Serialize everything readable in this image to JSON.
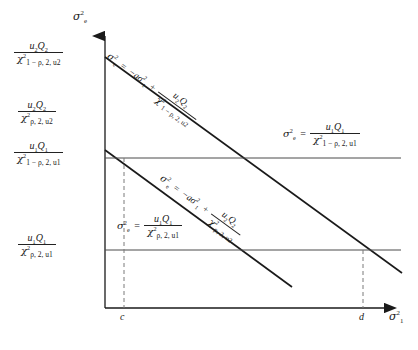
{
  "figure": {
    "type": "diagram",
    "title": "",
    "colors": {
      "line": "#1a1a1a",
      "thin_line": "#555555",
      "dashed": "#777777",
      "background": "#ffffff"
    }
  },
  "axes": {
    "y_label": {
      "base": "σ",
      "sup": "2",
      "sub": "e"
    },
    "x_label": {
      "base": "σ",
      "sup": "2",
      "sub": "1"
    },
    "x_ticks": [
      {
        "label": "c",
        "x": 124
      },
      {
        "label": "d",
        "x": 363
      }
    ]
  },
  "y_axis_labels": [
    {
      "id": "upper-diagonal-intercept",
      "num": {
        "u": "u",
        "u_sub": "2",
        "q": "Q",
        "q_sub": "2"
      },
      "den": {
        "chi": "χ",
        "chi_sup": "2",
        "chi_sub": "1 − ρ, 2, u",
        "chi_sub_sub": "2"
      },
      "y": 57
    },
    {
      "id": "lower-diagonal-intercept",
      "num": {
        "u": "u",
        "u_sub": "2",
        "q": "Q",
        "q_sub": "2"
      },
      "den": {
        "chi": "χ",
        "chi_sup": "2",
        "chi_sub": "ρ, 2, u",
        "chi_sub_sub": "2"
      },
      "y": 150
    },
    {
      "id": "upper-horizontal-level",
      "num": {
        "u": "u",
        "u_sub": "1",
        "q": "Q",
        "q_sub": "1"
      },
      "den": {
        "chi": "χ",
        "chi_sup": "2",
        "chi_sub": "1 − ρ, 2, u",
        "chi_sub_sub": "1"
      },
      "y": 158
    },
    {
      "id": "lower-horizontal-level",
      "num": {
        "u": "u",
        "u_sub": "1",
        "q": "Q",
        "q_sub": "1"
      },
      "den": {
        "chi": "χ",
        "chi_sup": "2",
        "chi_sub": "ρ, 2, u",
        "chi_sub_sub": "1"
      },
      "y": 250
    }
  ],
  "equations": {
    "upper_diagonal": {
      "lhs": {
        "base": "σ",
        "sup": "2",
        "sub": "e"
      },
      "eq": "=",
      "term": "−aσ",
      "term_sup": "2",
      "term_sub": "1",
      "plus": "+",
      "num": {
        "u": "u",
        "u_sub": "2",
        "q": "Q",
        "q_sub": "2"
      },
      "den": {
        "chi": "χ",
        "chi_sup": "2",
        "chi_sub": "1 − ρ, 2, u",
        "chi_sub_sub": "2"
      }
    },
    "lower_diagonal": {
      "lhs": {
        "base": "σ",
        "sup": "2",
        "sub": "e"
      },
      "eq": "=",
      "term": "−aσ",
      "term_sup": "2",
      "term_sub": "1",
      "plus": "+",
      "num": {
        "u": "u",
        "u_sub": "2",
        "q": "Q",
        "q_sub": "2"
      },
      "den": {
        "chi": "χ",
        "chi_sup": "2",
        "chi_sub": "ρ, 2, u",
        "chi_sub_sub": "2"
      }
    },
    "upper_horizontal": {
      "lhs": {
        "base": "σ",
        "sup": "2",
        "sub": "e"
      },
      "eq": "=",
      "num": {
        "u": "u",
        "u_sub": "1",
        "q": "Q",
        "q_sub": "1"
      },
      "den": {
        "chi": "χ",
        "chi_sup": "2",
        "chi_sub": "1 − ρ, 2, u",
        "chi_sub_sub": "1"
      }
    },
    "lower_horizontal": {
      "lhs": {
        "base": "σ",
        "sup": "2",
        "sub": "e"
      },
      "eq": "=",
      "num": {
        "u": "u",
        "u_sub": "1",
        "q": "Q",
        "q_sub": "1"
      },
      "den": {
        "chi": "χ",
        "chi_sup": "2",
        "chi_sub": "ρ, 2, u",
        "chi_sub_sub": "1"
      }
    }
  },
  "geometry": {
    "origin": {
      "x": 105,
      "y": 308
    },
    "y_axis_top": 30,
    "x_axis_right": 392,
    "upper_diagonal": {
      "x1": 105,
      "y1": 57,
      "x2": 400,
      "y2": 272
    },
    "lower_diagonal": {
      "x1": 105,
      "y1": 150,
      "x2": 290,
      "y2": 285
    },
    "upper_horizontal": {
      "x1": 105,
      "y1": 158,
      "x2": 400,
      "y2": 158
    },
    "lower_horizontal": {
      "x1": 105,
      "y1": 250,
      "x2": 400,
      "y2": 250
    },
    "dashed_c": {
      "x": 124,
      "y1": 158,
      "y2": 308
    },
    "dashed_d": {
      "x": 363,
      "y1": 250,
      "y2": 308
    }
  }
}
